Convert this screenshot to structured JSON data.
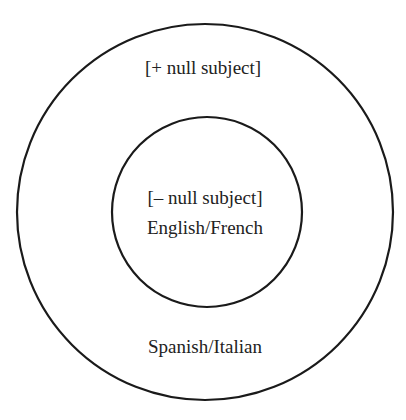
{
  "diagram": {
    "type": "nested-circles",
    "outer": {
      "label": "[+ null subject]",
      "languages": "Spanish/Italian"
    },
    "inner": {
      "label": "[– null subject]",
      "languages": "English/French"
    },
    "colors": {
      "stroke": "#1a1a1a",
      "text": "#222222",
      "background": "#ffffff"
    }
  }
}
